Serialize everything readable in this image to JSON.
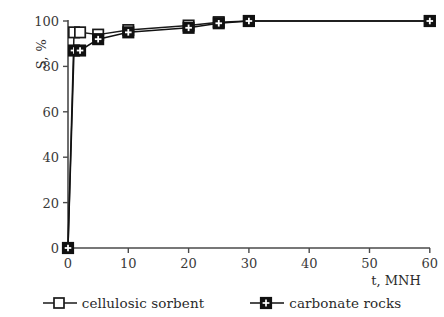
{
  "chart_data": {
    "type": "line",
    "title": "",
    "xlabel": "t, MNH",
    "ylabel": "S, %",
    "xlim": [
      0,
      60
    ],
    "ylim": [
      0,
      100
    ],
    "xticks": [
      0,
      10,
      20,
      30,
      40,
      50,
      60
    ],
    "yticks": [
      0,
      20,
      40,
      60,
      80,
      100
    ],
    "grid": false,
    "legend_position": "bottom",
    "series": [
      {
        "name": "cellulosic sorbent",
        "marker": "open-square",
        "color": "#1a1a1a",
        "x": [
          0,
          1,
          2,
          5,
          10,
          20,
          25,
          30,
          60
        ],
        "values": [
          0,
          95,
          95,
          94,
          96,
          98,
          99.5,
          100,
          100
        ]
      },
      {
        "name": "carbonate rocks",
        "marker": "filled-square-plus",
        "color": "#111111",
        "x": [
          0,
          1,
          2,
          5,
          10,
          20,
          25,
          30,
          60
        ],
        "values": [
          0,
          87,
          87,
          92,
          95,
          97,
          99,
          100,
          100
        ]
      }
    ]
  },
  "axes": {
    "y_title": "S, %",
    "x_title": "t, MNH",
    "x_tick_labels": [
      "0",
      "10",
      "20",
      "30",
      "40",
      "50",
      "60"
    ],
    "y_tick_labels": [
      "0",
      "20",
      "40",
      "60",
      "80",
      "100"
    ]
  },
  "legend": {
    "entries": [
      {
        "label": "cellulosic sorbent",
        "marker": "open-square-icon"
      },
      {
        "label": "carbonate rocks",
        "marker": "filled-square-plus-icon"
      }
    ]
  }
}
